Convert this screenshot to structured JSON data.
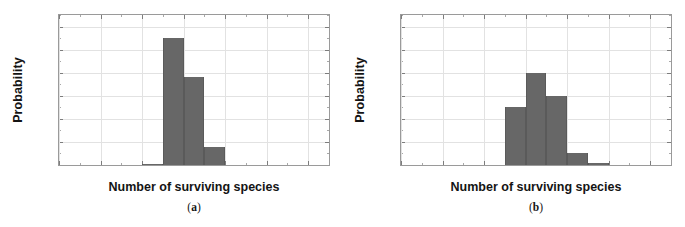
{
  "figure": {
    "background": "#ffffff",
    "bar_color": "#676767",
    "grid_color": "#e2e2e2",
    "frame_color": "#9a9a9a"
  },
  "panels": [
    {
      "key": "a",
      "caption": "(a)",
      "caption_prefix": "(",
      "caption_letter": "a",
      "caption_suffix": ")"
    },
    {
      "key": "b",
      "caption": "(b)",
      "caption_prefix": "(",
      "caption_letter": "b",
      "caption_suffix": ")"
    }
  ],
  "chart_data": [
    {
      "type": "bar",
      "panel": "a",
      "title": "",
      "xlabel": "Number of surviving species",
      "ylabel": "Probability",
      "xlim": [
        0,
        13
      ],
      "ylim": [
        0,
        0.65
      ],
      "xticks": [
        0,
        2,
        4,
        6,
        8,
        10,
        12
      ],
      "xtick_labels": [
        "0",
        "2",
        "4",
        "6",
        "8",
        "10",
        "12"
      ],
      "xticks_minor": [
        1,
        3,
        5,
        7,
        9,
        11,
        13
      ],
      "yticks": [
        0.0,
        0.1,
        0.2,
        0.3,
        0.4,
        0.5,
        0.6
      ],
      "ytick_labels": [
        "0.0",
        "0.1",
        "0.2",
        "0.3",
        "0.4",
        "0.5",
        "0.6"
      ],
      "yticks_minor": [
        0.05,
        0.15,
        0.25,
        0.35,
        0.45,
        0.55,
        0.65
      ],
      "grid": true,
      "legend": "none",
      "bin_edges": [
        4,
        5,
        6,
        7,
        8
      ],
      "bin_labels": [
        "4-5",
        "5-6",
        "6-7",
        "7-8"
      ],
      "values": [
        0.005,
        0.55,
        0.38,
        0.08
      ]
    },
    {
      "type": "bar",
      "panel": "b",
      "title": "",
      "xlabel": "Number of surviving species",
      "ylabel": "Probability",
      "xlim": [
        0,
        13
      ],
      "ylim": [
        0,
        0.65
      ],
      "xticks": [
        0,
        2,
        4,
        6,
        8,
        10,
        12
      ],
      "xtick_labels": [
        "0",
        "2",
        "4",
        "6",
        "8",
        "10",
        "12"
      ],
      "xticks_minor": [
        1,
        3,
        5,
        7,
        9,
        11,
        13
      ],
      "yticks": [
        0.0,
        0.1,
        0.2,
        0.3,
        0.4,
        0.5,
        0.6
      ],
      "ytick_labels": [
        "0.0",
        "0.1",
        "0.2",
        "0.3",
        "0.4",
        "0.5",
        "0.6"
      ],
      "yticks_minor": [
        0.05,
        0.15,
        0.25,
        0.35,
        0.45,
        0.55,
        0.65
      ],
      "grid": true,
      "legend": "none",
      "bin_edges": [
        5,
        6,
        7,
        8,
        9,
        10
      ],
      "bin_labels": [
        "5-6",
        "6-7",
        "7-8",
        "8-9",
        "9-10"
      ],
      "values": [
        0.25,
        0.4,
        0.3,
        0.05,
        0.01
      ]
    }
  ]
}
